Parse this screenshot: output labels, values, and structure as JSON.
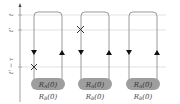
{
  "diagram": {
    "type": "time-contour",
    "axis": {
      "labels": [
        {
          "id": "t",
          "text": "t",
          "y": 15
        },
        {
          "id": "tp",
          "text": "t'",
          "y": 30
        },
        {
          "id": "tptau",
          "text": "t' − τ",
          "y": 67
        }
      ]
    },
    "contours": [
      {
        "label_top": "R",
        "sub_top": "A",
        "arg_top": "(0)",
        "label_bottom": "R",
        "sub_bottom": "B",
        "arg_bottom": "(0)",
        "marker": "x-at-t-prime-minus-tau"
      },
      {
        "label_top": "R",
        "sub_top": "A",
        "arg_top": "(0)",
        "label_bottom": "R",
        "sub_bottom": "B",
        "arg_bottom": "(0)",
        "marker": "x-at-t-prime"
      },
      {
        "label_top": "R",
        "sub_top": "A",
        "arg_top": "(0)",
        "label_bottom": "R",
        "sub_bottom": "B",
        "arg_bottom": "(0)",
        "marker": "none"
      }
    ],
    "colors": {
      "line": "#9a9a9a",
      "gridline": "#cfcfcf",
      "pill": "#9e9e9e",
      "arrow": "#111111"
    }
  }
}
